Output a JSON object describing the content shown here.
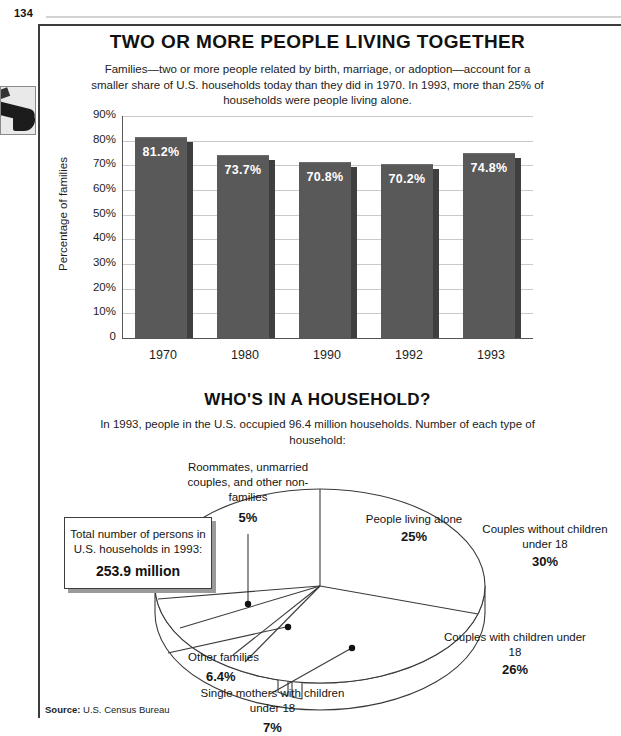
{
  "page": {
    "number": "134",
    "margin_thumbnail_name": "photo-thumbnail"
  },
  "bar_section": {
    "title": "TWO OR MORE PEOPLE LIVING TOGETHER",
    "subtitle": "Families—two or more people related by birth, marriage, or adoption—account for a smaller share of U.S. households today than they did in 1970. In 1993, more than 25% of households were people living alone."
  },
  "pie_section": {
    "title": "WHO'S IN A HOUSEHOLD?",
    "subtitle": "In 1993, people in the U.S. occupied 96.4 million households. Number of each type of household:"
  },
  "total_box": {
    "text": "Total number of persons in U.S. households in 1993:",
    "value": "253.9 million"
  },
  "footer": {
    "source_label": "Source:",
    "source_value": "U.S. Census Bureau"
  },
  "chart_data": [
    {
      "type": "bar",
      "title": "TWO OR MORE PEOPLE LIVING TOGETHER",
      "xlabel": "",
      "ylabel": "Percentage of families",
      "categories": [
        "1970",
        "1980",
        "1990",
        "1992",
        "1993"
      ],
      "values": [
        81.2,
        73.7,
        70.8,
        70.2,
        74.8
      ],
      "data_labels": [
        "81.2%",
        "73.7%",
        "70.8%",
        "70.2%",
        "74.8%"
      ],
      "ylim": [
        0,
        90
      ],
      "yticks": [
        0,
        10,
        20,
        30,
        40,
        50,
        60,
        70,
        80,
        90
      ],
      "ytick_labels": [
        "0",
        "10%",
        "20%",
        "30%",
        "40%",
        "50%",
        "60%",
        "70%",
        "80%",
        "90%"
      ],
      "grid": true,
      "legend": "none",
      "bar_color": "#595959"
    },
    {
      "type": "pie",
      "title": "WHO'S IN A HOUSEHOLD?",
      "subtitle": "In 1993, people in the U.S. occupied 96.4 million households. Number of each type of household:",
      "labels": [
        "Couples without children under 18",
        "Couples with children under 18",
        "Single mothers with children under 18",
        "Other families",
        "Roommates, unmarried couples, and other non-families",
        "People living alone"
      ],
      "values": [
        30,
        26,
        7,
        6.4,
        5,
        25
      ],
      "value_labels": [
        "30%",
        "26%",
        "7%",
        "6.4%",
        "5%",
        "25%"
      ],
      "legend": "none",
      "slice_color": "#ffffff",
      "outline_color": "#3a3a3a"
    }
  ],
  "pie_labels": {
    "inner": [
      {
        "name": "people-living-alone",
        "text": "People living alone",
        "value": "25%"
      },
      {
        "name": "couples-without-children",
        "text": "Couples without children under 18",
        "value": "30%"
      },
      {
        "name": "couples-with-children",
        "text": "Couples with children under 18",
        "value": "26%"
      }
    ],
    "outer": [
      {
        "name": "roommates-non-families",
        "text": "Roommates, unmarried couples, and other non-families",
        "value": "5%"
      },
      {
        "name": "other-families",
        "text": "Other families",
        "value": "6.4%"
      },
      {
        "name": "single-mothers",
        "text": "Single mothers with children under 18",
        "value": "7%"
      }
    ]
  }
}
